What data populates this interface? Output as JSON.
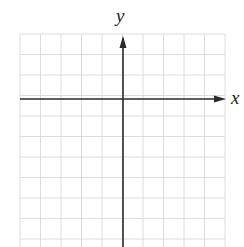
{
  "diagram": {
    "type": "cartesian-coordinate-grid",
    "axes": {
      "x_label": "x",
      "y_label": "y"
    },
    "grid": {
      "columns": 10,
      "rows_visible": 10,
      "left": 20,
      "right": 225,
      "top": 34,
      "bottom": 247,
      "cell_size": 20.5,
      "x_axis_y": 99,
      "y_axis_x": 123
    },
    "colors": {
      "grid_line": "#dcdcdc",
      "axis_line": "#2a2a2a",
      "background": "#ffffff"
    }
  }
}
